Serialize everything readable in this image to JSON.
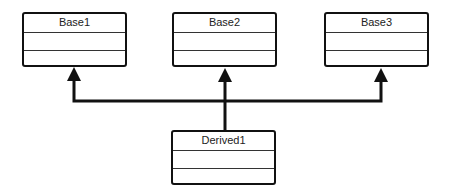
{
  "diagram": {
    "type": "uml-class-inheritance",
    "classes": [
      {
        "name": "Base1"
      },
      {
        "name": "Base2"
      },
      {
        "name": "Base3"
      },
      {
        "name": "Derived1"
      }
    ],
    "relations": [
      {
        "from": "Derived1",
        "to": "Base1",
        "kind": "generalization"
      },
      {
        "from": "Derived1",
        "to": "Base2",
        "kind": "generalization"
      },
      {
        "from": "Derived1",
        "to": "Base3",
        "kind": "generalization"
      }
    ]
  }
}
